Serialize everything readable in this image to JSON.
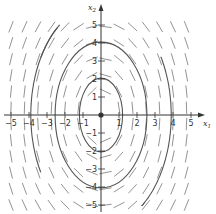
{
  "chart_data": {
    "type": "phase-portrait",
    "title": "",
    "xlabel": "x1",
    "ylabel": "x2",
    "xlim": [
      -5.5,
      5.8
    ],
    "ylim": [
      -5.3,
      6.0
    ],
    "grid": false,
    "legend": null,
    "x_ticks": [
      -5,
      -4,
      -3,
      -2,
      -1,
      1,
      2,
      3,
      4,
      5
    ],
    "y_ticks": [
      -5,
      -4,
      -3,
      -2,
      -1,
      1,
      2,
      3,
      4,
      5
    ],
    "equilibrium_point": [
      0,
      0
    ],
    "trajectories": [
      {
        "name": "inner ellipse",
        "shape": "ellipse",
        "center": [
          0,
          0
        ],
        "semi_x": 1.2,
        "semi_y": 2.05,
        "style": "solid"
      },
      {
        "name": "middle ellipse",
        "shape": "ellipse",
        "center": [
          0,
          0
        ],
        "semi_x": 2.55,
        "semi_y": 4.05,
        "style": "solid"
      },
      {
        "name": "outer ellipse",
        "shape": "ellipse",
        "center": [
          0,
          0
        ],
        "semi_x": 3.9,
        "semi_y": 6.2,
        "style": "solid",
        "visible_range_note": "clipped: upper-left arc and lower-right arc only"
      }
    ],
    "direction_field": "short dashed segments tangent to concentric ellipses, oriented clockwise"
  },
  "axes": {
    "x_label_main": "x",
    "x_label_sub": "1",
    "y_label_main": "x",
    "y_label_sub": "2"
  },
  "colors": {
    "axis": "#333333",
    "curve": "#555555",
    "field": "#777777",
    "background": "#ffffff"
  },
  "pixel_map": {
    "origin_px": [
      101,
      115
    ],
    "unit_px": 18
  }
}
